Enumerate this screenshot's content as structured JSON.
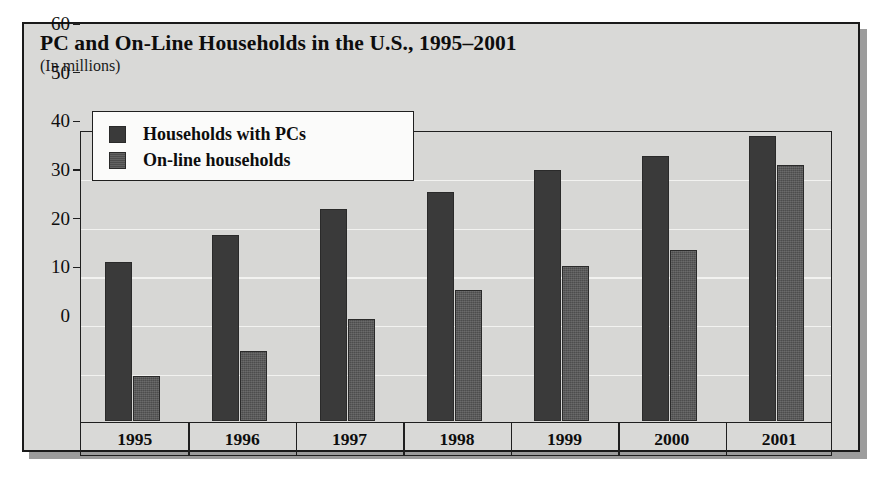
{
  "figure": {
    "title": "PC and On-Line Households in the U.S., 1995–2001",
    "subtitle": "(In millions)"
  },
  "legend": {
    "items": [
      {
        "label": "Households with PCs",
        "series": "pc",
        "color": "#3a3a3a"
      },
      {
        "label": "On-line households",
        "series": "online",
        "color": "#4d4d4d"
      }
    ]
  },
  "axes": {
    "y_ticks": [
      "0",
      "10",
      "20",
      "30",
      "40",
      "50",
      "60"
    ],
    "x_ticks": [
      "1995",
      "1996",
      "1997",
      "1998",
      "1999",
      "2000",
      "2001"
    ]
  },
  "chart_data": {
    "type": "bar",
    "title": "PC and On-Line Households in the U.S., 1995–2001",
    "subtitle": "(In millions)",
    "xlabel": "",
    "ylabel": "",
    "ylim": [
      0,
      60
    ],
    "ytick_step": 10,
    "grid": true,
    "legend_position": "upper-left-inside",
    "categories": [
      "1995",
      "1996",
      "1997",
      "1998",
      "1999",
      "2000",
      "2001"
    ],
    "series": [
      {
        "name": "Households with PCs",
        "color": "#3a3a3a",
        "values": [
          33,
          38.5,
          44,
          47.5,
          52,
          55,
          59
        ]
      },
      {
        "name": "On-line households",
        "color": "#4d4d4d",
        "values": [
          9.3,
          14.5,
          21,
          27,
          32,
          35.5,
          53
        ]
      }
    ]
  },
  "colors": {
    "panel_background": "#d9d9d7",
    "plot_background": "#d7d7d5",
    "gridline": "#f2f2f0",
    "frame": "#1a1a1a",
    "shadow": "#9c9c9c",
    "legend_background": "#fbfbfa"
  }
}
